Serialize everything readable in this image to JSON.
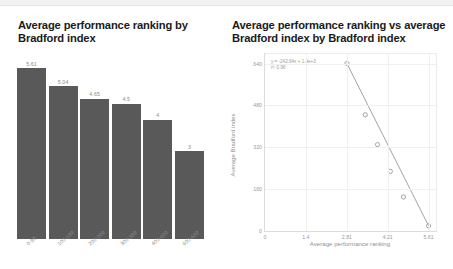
{
  "chart_data": [
    {
      "type": "bar",
      "title": "Average performance ranking by Bradford index",
      "xlabel": "",
      "ylabel": "",
      "categories": [
        "0-99",
        "100-199",
        "200-299",
        "300-399",
        "400-499",
        "600-699"
      ],
      "values": [
        5.61,
        5.04,
        4.65,
        4.5,
        4,
        3
      ],
      "value_labels": [
        "5.61",
        "5.04",
        "4.65",
        "4.5",
        "4",
        "3"
      ],
      "ylim": [
        0,
        5.9
      ],
      "grid": false,
      "legend": "none",
      "bar_color": "#595959",
      "label_color": "#8a8a8a",
      "tick_label_rotation": -40
    },
    {
      "type": "scatter",
      "title": "Average performance ranking vs average Bradford index by Bradford index",
      "xlabel": "Average performance ranking",
      "ylabel": "Average Bradford index",
      "x": [
        2.81,
        3.44,
        3.86,
        4.3,
        4.75,
        5.61
      ],
      "y": [
        640,
        444,
        330,
        228,
        130,
        20
      ],
      "points": [
        {
          "x": 2.81,
          "y": 640
        },
        {
          "x": 3.44,
          "y": 444
        },
        {
          "x": 3.86,
          "y": 330
        },
        {
          "x": 4.3,
          "y": 228
        },
        {
          "x": 4.75,
          "y": 130
        },
        {
          "x": 5.61,
          "y": 20
        }
      ],
      "xlim": [
        0,
        5.9
      ],
      "ylim": [
        0,
        680
      ],
      "xticks": [
        "0",
        "1.4",
        "2.81",
        "4.21",
        "5.61"
      ],
      "xtick_values": [
        0,
        1.4,
        2.81,
        4.21,
        5.61
      ],
      "yticks": [
        "640",
        "480",
        "320",
        "160",
        "0"
      ],
      "ytick_values": [
        640,
        480,
        320,
        160,
        0
      ],
      "trendline": {
        "equation": "y = -242.64x + 1.4e+3",
        "r_squared": "r²: 0.96",
        "slope": -242.64,
        "intercept": 1400
      },
      "grid": true,
      "legend": "none",
      "marker": "open-circle",
      "marker_color": "#9a9a9a",
      "line_color": "#8c8c8c"
    }
  ],
  "bar_panel": {
    "title": "Average performance ranking by Bradford index"
  },
  "scatter_panel": {
    "title": "Average performance ranking vs average Bradford index by Bradford index",
    "equation": "y = -242.64x + 1.4e+3",
    "r_squared": "r²: 0.96",
    "xlabel": "Average performance ranking",
    "ylabel": "Average Bradford index"
  },
  "colors": {
    "bar_fill": "#595959",
    "axis_text": "#9a9a9a",
    "title_text": "#1a1a1a",
    "grid": "#f0f0f0",
    "top_band": "#f2f2f2"
  }
}
